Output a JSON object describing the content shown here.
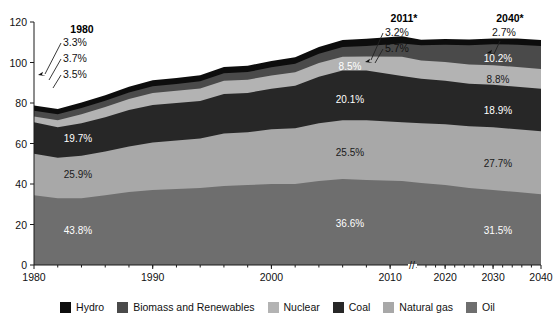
{
  "figure": {
    "clipped_top_text": "",
    "axis_break_marker": "//"
  },
  "axes": {
    "y_ticks": [
      "0",
      "20",
      "40",
      "60",
      "80",
      "100",
      "120"
    ],
    "x_ticks": [
      "1980",
      "1990",
      "2000",
      "2010",
      "2020",
      "2030",
      "2040"
    ],
    "ylim": [
      0,
      120
    ]
  },
  "annotations": {
    "year_1980": "1980",
    "year_2011": "2011*",
    "year_2040": "2040*",
    "callouts_1980": [
      "3.3%",
      "3.7%",
      "3.5%"
    ],
    "callouts_2011": [
      "3.2%",
      "5.7%"
    ],
    "callouts_2040": [
      "2.7%"
    ],
    "labels_1980": [
      "19.7%",
      "25.9%",
      "43.8%"
    ],
    "labels_2011": [
      "8.5%",
      "20.1%",
      "25.5%",
      "36.6%"
    ],
    "labels_2040": [
      "10.2%",
      "8.8%",
      "18.9%",
      "27.7%",
      "31.5%"
    ]
  },
  "legend": {
    "items": [
      {
        "label": "Hydro",
        "color": "#0d0d0d"
      },
      {
        "label": "Biomass and Renewables",
        "color": "#4a4a4a"
      },
      {
        "label": "Nuclear",
        "color": "#b3b3b3"
      },
      {
        "label": "Coal",
        "color": "#272727"
      },
      {
        "label": "Natural gas",
        "color": "#a8a8a8"
      },
      {
        "label": "Oil",
        "color": "#6e6e6e"
      }
    ]
  },
  "chart_data": {
    "type": "area",
    "title": "",
    "xlabel": "",
    "ylabel": "",
    "ylim": [
      0,
      120
    ],
    "grid": false,
    "legend_position": "bottom",
    "stacked": true,
    "axis_break_between": [
      2010,
      2020
    ],
    "x": [
      1980,
      1982,
      1984,
      1986,
      1988,
      1990,
      1992,
      1994,
      1996,
      1998,
      2000,
      2002,
      2004,
      2006,
      2008,
      2011,
      2015,
      2020,
      2025,
      2030,
      2035,
      2040
    ],
    "series": [
      {
        "name": "Oil",
        "color": "#6e6e6e",
        "values": [
          34.5,
          33.0,
          33.0,
          34.5,
          36.0,
          37.0,
          37.5,
          38.0,
          39.0,
          39.5,
          40.0,
          40.0,
          41.5,
          42.5,
          42.0,
          41.5,
          40.5,
          39.5,
          38.0,
          37.0,
          36.0,
          35.0
        ]
      },
      {
        "name": "Natural gas",
        "color": "#a8a8a8",
        "values": [
          20.5,
          20.0,
          21.0,
          21.5,
          22.5,
          23.5,
          24.0,
          24.5,
          26.0,
          26.0,
          27.0,
          27.5,
          28.5,
          29.0,
          29.5,
          29.0,
          29.5,
          30.0,
          30.5,
          31.0,
          31.0,
          31.0
        ]
      },
      {
        "name": "Coal",
        "color": "#272727",
        "values": [
          15.5,
          15.0,
          16.0,
          17.0,
          18.0,
          18.5,
          18.5,
          18.5,
          19.5,
          19.5,
          20.0,
          21.0,
          23.0,
          24.5,
          24.5,
          22.8,
          22.0,
          21.5,
          21.0,
          21.0,
          21.0,
          21.0
        ]
      },
      {
        "name": "Nuclear",
        "color": "#b3b3b3",
        "values": [
          2.8,
          3.5,
          4.5,
          5.0,
          5.5,
          6.0,
          6.0,
          6.2,
          6.5,
          6.5,
          6.6,
          6.7,
          6.8,
          6.9,
          7.0,
          9.6,
          9.0,
          9.3,
          9.5,
          9.7,
          9.8,
          9.8
        ]
      },
      {
        "name": "Biomass and Renewables",
        "color": "#4a4a4a",
        "values": [
          2.9,
          2.9,
          3.0,
          3.1,
          3.2,
          3.3,
          3.4,
          3.5,
          3.7,
          3.8,
          4.0,
          4.2,
          4.5,
          4.8,
          5.2,
          6.5,
          7.5,
          8.5,
          9.5,
          10.3,
          11.0,
          11.3
        ]
      },
      {
        "name": "Hydro",
        "color": "#0d0d0d",
        "values": [
          2.6,
          2.6,
          2.7,
          2.7,
          2.8,
          2.9,
          2.9,
          3.0,
          3.1,
          3.1,
          3.2,
          3.2,
          3.3,
          3.4,
          3.5,
          3.6,
          2.7,
          2.8,
          2.9,
          2.9,
          3.0,
          3.0
        ]
      }
    ],
    "share_labels": {
      "1980": {
        "Oil": "43.8%",
        "Natural gas": "25.9%",
        "Coal": "19.7%",
        "Nuclear": "3.5%",
        "Biomass and Renewables": "3.7%",
        "Hydro": "3.3%"
      },
      "2011": {
        "Oil": "36.6%",
        "Natural gas": "25.5%",
        "Coal": "20.1%",
        "Nuclear": "8.5%",
        "Biomass and Renewables": "5.7%",
        "Hydro": "3.2%"
      },
      "2040": {
        "Oil": "31.5%",
        "Natural gas": "27.7%",
        "Coal": "18.9%",
        "Nuclear": "8.8%",
        "Biomass and Renewables": "10.2%",
        "Hydro": "2.7%"
      }
    }
  }
}
